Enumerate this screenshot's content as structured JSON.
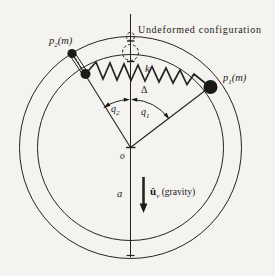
{
  "figure": {
    "annotation_title": "Undeformed configuration",
    "labels": {
      "mass2": {
        "base": "p",
        "sub": "2",
        "suffix": "(m)"
      },
      "mass1": {
        "base": "p",
        "sub": "1",
        "suffix": "(m)"
      },
      "spring_constant": "k",
      "spring_stretch": "Δ",
      "angle2": {
        "base": "q",
        "sub": "2"
      },
      "angle1": {
        "base": "q",
        "sub": "1"
      },
      "origin": "o",
      "radius": "a",
      "gravity_vector": {
        "base": "û",
        "sub": "v",
        "suffix": " (gravity)"
      }
    },
    "colors": {
      "ink": "#1c1a17",
      "background": "#f4f3f0"
    }
  }
}
